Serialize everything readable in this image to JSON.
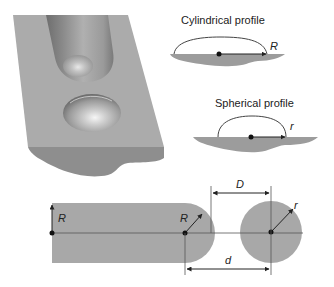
{
  "figure": {
    "top_left": {
      "description": "3D rendered substrate with cylindrical bead and spherical droplet",
      "colors": {
        "top_face": "#a9a9a9",
        "front_face": "#8e8e8e",
        "bead": "#9a9a9a"
      }
    },
    "cylindrical_profile": {
      "title": "Cylindrical profile",
      "radius_label": "R"
    },
    "spherical_profile": {
      "title": "Spherical profile",
      "radius_label": "r"
    },
    "bottom_schematic": {
      "bar_radius_label": "R",
      "end_radius_label": "R",
      "droplet_radius_label": "r",
      "gap_label": "D",
      "center_distance_label": "d",
      "colors": {
        "fill": "#a8a8a8",
        "line": "#444444",
        "dot": "#111111"
      }
    }
  }
}
